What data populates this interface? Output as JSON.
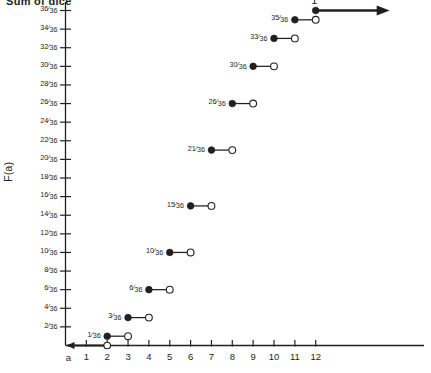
{
  "title_partial": "Sum of dice",
  "axes": {
    "y_axis_title": "F(a)",
    "x_axis_origin_label": "a",
    "y_tick_labels": [
      "2/36",
      "4/36",
      "6/36",
      "8/36",
      "10/36",
      "12/36",
      "14/36",
      "16/36",
      "18/36",
      "20/36",
      "22/36",
      "24/36",
      "26/36",
      "28/36",
      "30/36",
      "32/36",
      "34/36",
      "36/36"
    ],
    "x_tick_labels": [
      "1",
      "2",
      "3",
      "4",
      "5",
      "6",
      "7",
      "8",
      "9",
      "10",
      "11",
      "12"
    ],
    "top_level_label": "1"
  },
  "colors": {
    "ink": "#231f20",
    "background": "#ffffff"
  },
  "chart_data": {
    "type": "line",
    "title": "Sum of dice",
    "xlabel": "a",
    "ylabel": "F(a)",
    "xlim": [
      0,
      13.5
    ],
    "ylim": [
      0,
      1.03
    ],
    "grid": false,
    "legend": null,
    "y_tick_values": [
      0.0556,
      0.1111,
      0.1667,
      0.2222,
      0.2778,
      0.3333,
      0.3889,
      0.4444,
      0.5,
      0.5556,
      0.6111,
      0.6667,
      0.7222,
      0.7778,
      0.8333,
      0.8889,
      0.9444,
      1.0
    ],
    "x_tick_values": [
      1,
      2,
      3,
      4,
      5,
      6,
      7,
      8,
      9,
      10,
      11,
      12
    ],
    "steps": [
      {
        "label": "1/36",
        "value": 0.02778,
        "x_start": 2,
        "x_end": 3,
        "closed_left": true,
        "open_right": true
      },
      {
        "label": "3/36",
        "value": 0.08333,
        "x_start": 3,
        "x_end": 4,
        "closed_left": true,
        "open_right": true
      },
      {
        "label": "6/36",
        "value": 0.16667,
        "x_start": 4,
        "x_end": 5,
        "closed_left": true,
        "open_right": true
      },
      {
        "label": "10/36",
        "value": 0.27778,
        "x_start": 5,
        "x_end": 6,
        "closed_left": true,
        "open_right": true
      },
      {
        "label": "15/36",
        "value": 0.41667,
        "x_start": 6,
        "x_end": 7,
        "closed_left": true,
        "open_right": true
      },
      {
        "label": "21/36",
        "value": 0.58333,
        "x_start": 7,
        "x_end": 8,
        "closed_left": true,
        "open_right": true
      },
      {
        "label": "26/36",
        "value": 0.72222,
        "x_start": 8,
        "x_end": 9,
        "closed_left": true,
        "open_right": true
      },
      {
        "label": "30/36",
        "value": 0.83333,
        "x_start": 9,
        "x_end": 10,
        "closed_left": true,
        "open_right": true
      },
      {
        "label": "33/36",
        "value": 0.91667,
        "x_start": 10,
        "x_end": 11,
        "closed_left": true,
        "open_right": true
      },
      {
        "label": "35/36",
        "value": 0.97222,
        "x_start": 11,
        "x_end": 12,
        "closed_left": true,
        "open_right": true
      },
      {
        "label": "1",
        "value": 1.0,
        "x_start": 12,
        "x_end": null,
        "closed_left": true,
        "open_right": false,
        "ray": "right"
      }
    ],
    "zero_segment": {
      "value": 0,
      "x_start": null,
      "x_end": 2,
      "open_right": true,
      "ray": "left"
    }
  }
}
